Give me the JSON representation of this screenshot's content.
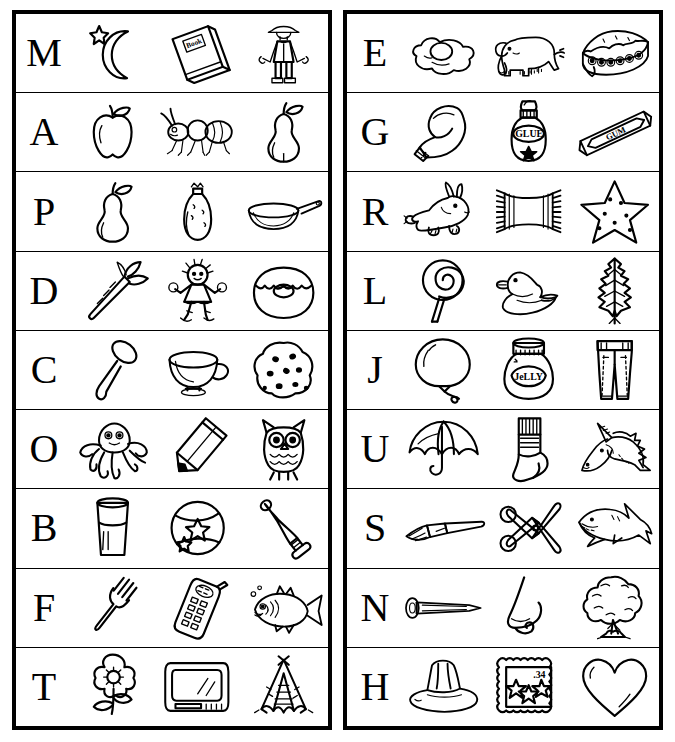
{
  "worksheet": {
    "title": "Beginning Sounds Alphabet Picture Chart",
    "panels": [
      {
        "id": "left",
        "rows": [
          {
            "letter": "M",
            "pictures": [
              "moon",
              "book",
              "man"
            ]
          },
          {
            "letter": "A",
            "pictures": [
              "apple",
              "ant",
              "pear"
            ]
          },
          {
            "letter": "P",
            "pictures": [
              "pear",
              "pinata",
              "pan"
            ]
          },
          {
            "letter": "D",
            "pictures": [
              "carrot",
              "doll",
              "donut"
            ]
          },
          {
            "letter": "C",
            "pictures": [
              "spoon",
              "cup",
              "cookie"
            ]
          },
          {
            "letter": "O",
            "pictures": [
              "octopus",
              "pencil",
              "owl"
            ]
          },
          {
            "letter": "B",
            "pictures": [
              "glass",
              "ball",
              "bat"
            ]
          },
          {
            "letter": "F",
            "pictures": [
              "fork",
              "phone",
              "fish"
            ]
          },
          {
            "letter": "T",
            "pictures": [
              "flower",
              "television",
              "teepee"
            ]
          }
        ]
      },
      {
        "id": "right",
        "rows": [
          {
            "letter": "E",
            "pictures": [
              "egg",
              "elephant",
              "pie"
            ]
          },
          {
            "letter": "G",
            "pictures": [
              "glove",
              "glue",
              "gum"
            ]
          },
          {
            "letter": "R",
            "pictures": [
              "rabbit",
              "rug",
              "star"
            ]
          },
          {
            "letter": "L",
            "pictures": [
              "lollipop",
              "duck",
              "leaf"
            ]
          },
          {
            "letter": "J",
            "pictures": [
              "balloon",
              "jelly",
              "jeans"
            ]
          },
          {
            "letter": "U",
            "pictures": [
              "umbrella",
              "sock",
              "unicorn"
            ]
          },
          {
            "letter": "S",
            "pictures": [
              "paintbrush",
              "scissors",
              "shark"
            ]
          },
          {
            "letter": "N",
            "pictures": [
              "nail",
              "nose",
              "tree"
            ]
          },
          {
            "letter": "H",
            "pictures": [
              "hat",
              "stamp",
              "heart"
            ]
          }
        ]
      }
    ]
  },
  "inline_labels": {
    "book": "Book",
    "glue": "GLUE",
    "gum": "GUM",
    "jelly": "JeLLY",
    "stamp": ".34"
  },
  "colors": {
    "ink": "#000000",
    "paper": "#ffffff"
  }
}
